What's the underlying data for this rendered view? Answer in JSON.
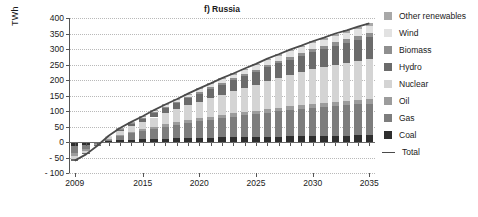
{
  "chart_data": {
    "type": "bar",
    "subtype": "stacked-bar-with-line",
    "title": "f) Russia",
    "xlabel": "",
    "ylabel": "TWh",
    "ylim": [
      -100,
      400
    ],
    "ytick_values": [
      -100,
      -50,
      0,
      50,
      100,
      150,
      200,
      250,
      300,
      350,
      400
    ],
    "ytick_labels": [
      "- 100",
      "- 50",
      "0",
      "50",
      "100",
      "150",
      "200",
      "250",
      "300",
      "350",
      "400"
    ],
    "grid": true,
    "legend_position": "right",
    "x": [
      2009,
      2010,
      2011,
      2012,
      2013,
      2014,
      2015,
      2016,
      2017,
      2018,
      2019,
      2020,
      2021,
      2022,
      2023,
      2024,
      2025,
      2026,
      2027,
      2028,
      2029,
      2030,
      2031,
      2032,
      2033,
      2034,
      2035
    ],
    "xtick_values": [
      2009,
      2015,
      2020,
      2025,
      2030,
      2035
    ],
    "xtick_labels": [
      "2009",
      "2015",
      "2020",
      "2025",
      "2030",
      "2035"
    ],
    "series": [
      {
        "name": "Coal",
        "color": "#2e2e2e",
        "values": [
          -14,
          -10,
          -3,
          3,
          6,
          8,
          9,
          10,
          11,
          12,
          13,
          14,
          14,
          15,
          15,
          16,
          16,
          17,
          17,
          18,
          18,
          19,
          19,
          20,
          20,
          21,
          21
        ]
      },
      {
        "name": "Gas",
        "color": "#7d7d7d",
        "values": [
          -22,
          -14,
          -4,
          6,
          14,
          20,
          26,
          32,
          38,
          43,
          48,
          53,
          58,
          62,
          66,
          70,
          74,
          78,
          82,
          85,
          88,
          91,
          94,
          96,
          98,
          100,
          102
        ]
      },
      {
        "name": "Oil",
        "color": "#9c9c9c",
        "values": [
          -9,
          -6,
          -2,
          2,
          4,
          5,
          6,
          7,
          8,
          8,
          9,
          9,
          10,
          10,
          11,
          11,
          11,
          12,
          12,
          12,
          13,
          13,
          13,
          14,
          14,
          14,
          15
        ]
      },
      {
        "name": "Nuclear",
        "color": "#d4d4d4",
        "values": [
          -11,
          -7,
          -2,
          5,
          12,
          18,
          24,
          30,
          36,
          42,
          48,
          54,
          60,
          66,
          72,
          78,
          84,
          90,
          96,
          101,
          106,
          111,
          115,
          119,
          123,
          126,
          130
        ]
      },
      {
        "name": "Hydro",
        "color": "#6b6b6b",
        "values": [
          -4,
          -3,
          -1,
          2,
          5,
          8,
          11,
          14,
          17,
          20,
          23,
          26,
          29,
          32,
          35,
          38,
          41,
          44,
          47,
          50,
          53,
          56,
          59,
          62,
          65,
          68,
          71
        ]
      },
      {
        "name": "Biomass",
        "color": "#8f8f8f",
        "values": [
          0,
          0,
          0,
          1,
          1,
          2,
          2,
          3,
          3,
          4,
          4,
          5,
          5,
          6,
          6,
          7,
          7,
          8,
          8,
          9,
          9,
          10,
          10,
          11,
          11,
          12,
          12
        ]
      },
      {
        "name": "Wind",
        "color": "#e2e2e2",
        "values": [
          0,
          0,
          0,
          1,
          2,
          3,
          4,
          5,
          6,
          7,
          8,
          9,
          10,
          11,
          12,
          13,
          14,
          15,
          16,
          17,
          18,
          19,
          20,
          21,
          22,
          23,
          24
        ]
      },
      {
        "name": "Other renewables",
        "color": "#a8a8a8",
        "values": [
          0,
          0,
          0,
          0,
          1,
          1,
          1,
          2,
          2,
          2,
          3,
          3,
          3,
          4,
          4,
          4,
          5,
          5,
          5,
          6,
          6,
          6,
          7,
          7,
          7,
          8,
          8
        ]
      }
    ],
    "total_line": {
      "name": "Total",
      "color": "#4a4a4a",
      "values": [
        -60,
        -40,
        -12,
        20,
        45,
        65,
        83,
        103,
        121,
        138,
        156,
        173,
        189,
        206,
        221,
        237,
        252,
        269,
        283,
        298,
        311,
        325,
        337,
        350,
        360,
        372,
        383
      ]
    }
  },
  "legend": {
    "entries": [
      {
        "label": "Other renewables",
        "color": "#a8a8a8",
        "marker": "swatch"
      },
      {
        "label": "Wind",
        "color": "#e2e2e2",
        "marker": "swatch"
      },
      {
        "label": "Biomass",
        "color": "#8f8f8f",
        "marker": "swatch"
      },
      {
        "label": "Hydro",
        "color": "#6b6b6b",
        "marker": "swatch"
      },
      {
        "label": "Nuclear",
        "color": "#d4d4d4",
        "marker": "swatch"
      },
      {
        "label": "Oil",
        "color": "#9c9c9c",
        "marker": "swatch"
      },
      {
        "label": "Gas",
        "color": "#7d7d7d",
        "marker": "swatch"
      },
      {
        "label": "Coal",
        "color": "#2e2e2e",
        "marker": "swatch"
      },
      {
        "label": "Total",
        "color": "#4a4a4a",
        "marker": "line"
      }
    ]
  }
}
